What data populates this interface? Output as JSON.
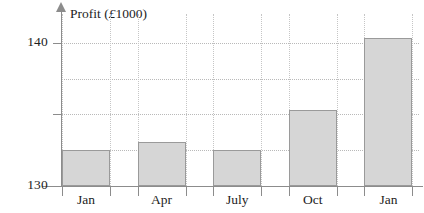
{
  "chart_data": {
    "type": "bar",
    "title": "Profit (£1000)",
    "title_prefix": "Profit (",
    "title_currency": "£",
    "title_suffix": "1000)",
    "xlabel": "",
    "ylabel": "Profit (£1000)",
    "categories": [
      "Jan",
      "Apr",
      "July",
      "Oct",
      "Jan"
    ],
    "values": [
      132.5,
      133.1,
      132.5,
      135.3,
      140.3
    ],
    "ylim": [
      130,
      142
    ],
    "y_tick_labels": [
      "130",
      "140"
    ],
    "y_ticks_labeled": [
      130,
      140
    ],
    "y_gridlines": [
      132.5,
      135,
      137.5,
      140
    ],
    "grid": "dotted",
    "legend": "none",
    "bar_color": "#d6d6d6",
    "bar_border_color": "#9a9a9a",
    "axis_color": "#8c8c8c",
    "grid_color": "#b9b9b9",
    "text_color": "#1d1d1d"
  }
}
